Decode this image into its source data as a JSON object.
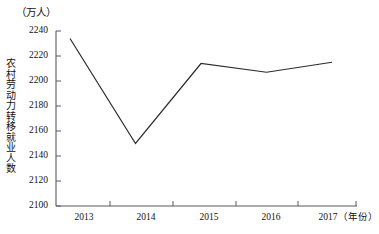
{
  "chart_data": {
    "type": "line",
    "title": "",
    "unit_label": "（万人）",
    "ylabel": "农村劳动力转移就业人数",
    "xlabel": "（年份）",
    "categories": [
      "2013",
      "2014",
      "2015",
      "2016",
      "2017"
    ],
    "values": [
      2234,
      2150,
      2214,
      2207,
      2215
    ],
    "series": [
      {
        "name": "农村劳动力转移就业人数",
        "values": [
          2234,
          2150,
          2214,
          2207,
          2215
        ]
      }
    ],
    "ylim": [
      2100,
      2240
    ],
    "yticks": [
      "2100",
      "2120",
      "2140",
      "2160",
      "2180",
      "2200",
      "2220",
      "2240"
    ],
    "xticks": [
      "2013",
      "2014",
      "2015",
      "2016",
      "2017"
    ],
    "grid": false,
    "legend": "none",
    "line_color": "#2b2b2b",
    "axis_color": "#5a5a5a"
  }
}
